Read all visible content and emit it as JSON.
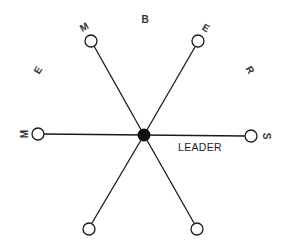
{
  "diagram": {
    "type": "star-network",
    "hub": {
      "label": "LEADER",
      "role": "leader"
    },
    "members": [
      {
        "id": "left"
      },
      {
        "id": "top-left"
      },
      {
        "id": "top-right"
      },
      {
        "id": "right"
      },
      {
        "id": "bottom-right"
      },
      {
        "id": "bottom-left"
      }
    ],
    "ring_word": "MEMBERS",
    "ring_letters": [
      "M",
      "E",
      "M",
      "B",
      "E",
      "R",
      "S"
    ],
    "colors": {
      "line": "#1a1a1a",
      "hub": "#111111",
      "background": "#ffffff"
    }
  }
}
